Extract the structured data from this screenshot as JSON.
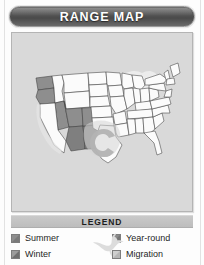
{
  "header": {
    "title": "RANGE MAP"
  },
  "map": {
    "region": "United States",
    "panel_background": "#d9d9d9",
    "state_fill": "#fbfbfb",
    "state_stroke": "#3c3c3c",
    "shading": {
      "summer": "#8e8e8e",
      "winter": "#6f6f6f",
      "year_round": "#7f7f7f",
      "migration": "#cfcfcf"
    },
    "shaded_areas": [
      {
        "name": "pacific-northwest-summer",
        "category": "Summer"
      },
      {
        "name": "great-basin-summer",
        "category": "Summer"
      },
      {
        "name": "california-coast-migration",
        "category": "Migration"
      },
      {
        "name": "desert-southwest-year-round",
        "category": "Year-round"
      },
      {
        "name": "southern-plains-migration",
        "category": "Migration"
      },
      {
        "name": "great-lakes-migration",
        "category": "Migration"
      }
    ]
  },
  "legend": {
    "title": "LEGEND",
    "bird_icon": "hummingbird-icon",
    "columns": [
      {
        "items": [
          {
            "label": "Summer",
            "swatch": "summer",
            "color": "#8e8e8e"
          },
          {
            "label": "Winter",
            "swatch": "winter",
            "color": "#6f6f6f"
          }
        ]
      },
      {
        "items": [
          {
            "label": "Year-round",
            "swatch": "yearround",
            "color": "#7f7f7f"
          },
          {
            "label": "Migration",
            "swatch": "migration",
            "color": "#cfcfcf"
          }
        ]
      }
    ]
  }
}
